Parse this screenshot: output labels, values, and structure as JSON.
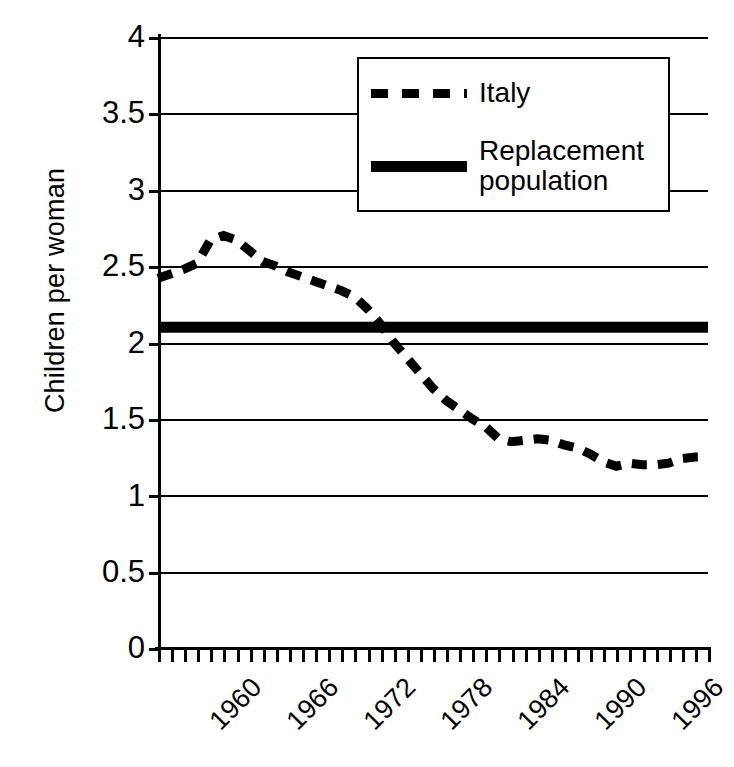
{
  "chart_data": {
    "type": "line",
    "title": "",
    "subtitle": "",
    "xlabel": "",
    "ylabel": "Children per woman",
    "xlim": [
      1960,
      2002
    ],
    "ylim": [
      0,
      4
    ],
    "grid": true,
    "legend_position": "top-right",
    "y_ticks": [
      "4",
      "3.5",
      "3",
      "2.5",
      "2",
      "1.5",
      "1",
      "0.5",
      "0"
    ],
    "y_tick_values": [
      4,
      3.5,
      3,
      2.5,
      2,
      1.5,
      1,
      0.5,
      0
    ],
    "x_ticks": [
      "1960",
      "1966",
      "1972",
      "1978",
      "1984",
      "1990",
      "1996",
      "2002"
    ],
    "x_tick_values": [
      1960,
      1966,
      1972,
      1978,
      1984,
      1990,
      1996,
      2002
    ],
    "x_minor_tick_interval": 1,
    "x": [
      1960,
      1961,
      1962,
      1963,
      1964,
      1965,
      1966,
      1967,
      1968,
      1969,
      1970,
      1971,
      1972,
      1973,
      1974,
      1975,
      1976,
      1977,
      1978,
      1979,
      1980,
      1981,
      1982,
      1983,
      1984,
      1985,
      1986,
      1987,
      1988,
      1989,
      1990,
      1991,
      1992,
      1993,
      1994,
      1995,
      1996,
      1997,
      1998,
      1999,
      2000,
      2001,
      2002
    ],
    "series": [
      {
        "name": "Italy",
        "style": "dashed",
        "color": "#000000",
        "values": [
          2.42,
          2.45,
          2.48,
          2.52,
          2.67,
          2.7,
          2.67,
          2.6,
          2.53,
          2.5,
          2.46,
          2.43,
          2.4,
          2.37,
          2.34,
          2.3,
          2.22,
          2.12,
          2.0,
          1.9,
          1.8,
          1.7,
          1.62,
          1.56,
          1.5,
          1.45,
          1.37,
          1.35,
          1.36,
          1.37,
          1.36,
          1.33,
          1.31,
          1.27,
          1.22,
          1.19,
          1.21,
          1.2,
          1.2,
          1.21,
          1.24,
          1.25,
          1.25
        ]
      },
      {
        "name": "Replacement population",
        "style": "solid",
        "color": "#000000",
        "constant_value": 2.1,
        "values": [
          2.1,
          2.1,
          2.1,
          2.1,
          2.1,
          2.1,
          2.1,
          2.1,
          2.1,
          2.1,
          2.1,
          2.1,
          2.1,
          2.1,
          2.1,
          2.1,
          2.1,
          2.1,
          2.1,
          2.1,
          2.1,
          2.1,
          2.1,
          2.1,
          2.1,
          2.1,
          2.1,
          2.1,
          2.1,
          2.1,
          2.1,
          2.1,
          2.1,
          2.1,
          2.1,
          2.1,
          2.1,
          2.1,
          2.1,
          2.1,
          2.1,
          2.1,
          2.1
        ]
      }
    ]
  },
  "legend": {
    "items": [
      {
        "label": "Italy",
        "key": "dashed-line-key"
      },
      {
        "label": "Replacement\npopulation",
        "label_line1": "Replacement",
        "label_line2": "population",
        "key": "solid-line-key"
      }
    ]
  },
  "axes": {
    "y_title": "Children per woman"
  }
}
